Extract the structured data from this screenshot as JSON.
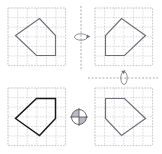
{
  "figure": {
    "background_color": "#ffffff",
    "width": 162,
    "height": 154
  },
  "colors": {
    "grid": "#c9c9cf",
    "shape_light": "#6e6e76",
    "shape_dark": "#16161a",
    "axis": "#8e8e96",
    "symbol": "#70707a"
  },
  "grids": [
    {
      "id": "top-left",
      "label": "Original figure",
      "origin_x": 8,
      "origin_y": 8,
      "cell_size": 9.6,
      "cols": 6,
      "rows": 6,
      "shape_style": "light",
      "shape_points": "15.5,35.5 39.5,18.5 55.5,35.5 55.5,55.5 36.5,55.5",
      "vertices": [
        {
          "x": 15.5,
          "y": 35.5
        },
        {
          "x": 39.5,
          "y": 18.5
        },
        {
          "x": 55.5,
          "y": 35.5
        },
        {
          "x": 55.5,
          "y": 55.5
        },
        {
          "x": 36.5,
          "y": 55.5
        }
      ]
    },
    {
      "id": "top-right",
      "label": "Reflection across vertical axis",
      "origin_x": 95,
      "origin_y": 8,
      "cell_size": 9.6,
      "cols": 6,
      "rows": 6,
      "shape_style": "light",
      "shape_points": "145.5,35.5 121.5,18.5 105.5,35.5 105.5,55.5 124.5,55.5",
      "vertices": [
        {
          "x": 145.5,
          "y": 35.5
        },
        {
          "x": 121.5,
          "y": 18.5
        },
        {
          "x": 105.5,
          "y": 35.5
        },
        {
          "x": 105.5,
          "y": 55.5
        },
        {
          "x": 124.5,
          "y": 55.5
        }
      ]
    },
    {
      "id": "bottom-left",
      "label": "Reflection across horizontal axis",
      "origin_x": 8,
      "origin_y": 88,
      "cell_size": 9.6,
      "cols": 6,
      "rows": 6,
      "shape_style": "dark",
      "shape_points": "15.5,118.5 39.5,135.5 55.5,118.5 55.5,98.5 36.5,98.5",
      "vertices": [
        {
          "x": 15.5,
          "y": 118.5
        },
        {
          "x": 39.5,
          "y": 135.5
        },
        {
          "x": 55.5,
          "y": 118.5
        },
        {
          "x": 55.5,
          "y": 98.5
        },
        {
          "x": 36.5,
          "y": 98.5
        }
      ]
    },
    {
      "id": "bottom-right",
      "label": "Point symmetry (180 degree rotation)",
      "origin_x": 95,
      "origin_y": 88,
      "cell_size": 9.6,
      "cols": 6,
      "rows": 6,
      "shape_style": "light",
      "shape_points": "145.5,118.5 121.5,135.5 105.5,118.5 105.5,98.5 124.5,98.5",
      "vertices": [
        {
          "x": 145.5,
          "y": 118.5
        },
        {
          "x": 121.5,
          "y": 135.5
        },
        {
          "x": 105.5,
          "y": 118.5
        },
        {
          "x": 105.5,
          "y": 98.5
        },
        {
          "x": 124.5,
          "y": 98.5
        }
      ]
    }
  ],
  "axes": [
    {
      "id": "vertical-mirror-axis",
      "orientation": "vertical",
      "x1": 81,
      "y1": 6,
      "x2": 81,
      "y2": 70
    },
    {
      "id": "horizontal-mirror-axis",
      "orientation": "horizontal",
      "x1": 88,
      "y1": 78,
      "x2": 158,
      "y2": 78
    }
  ],
  "symbols": [
    {
      "id": "vertical-rotation-symbol",
      "name": "rotation-about-vertical-axis-icon",
      "cx": 81,
      "cy": 37,
      "rx": 6.5,
      "ry": 3.2
    },
    {
      "id": "horizontal-rotation-symbol",
      "name": "rotation-about-horizontal-axis-icon",
      "cx": 124,
      "cy": 78,
      "rx": 3.2,
      "ry": 6.5
    },
    {
      "id": "point-symmetry-symbol",
      "name": "point-symmetry-icon",
      "cx": 79,
      "cy": 117,
      "r": 7.5
    }
  ]
}
